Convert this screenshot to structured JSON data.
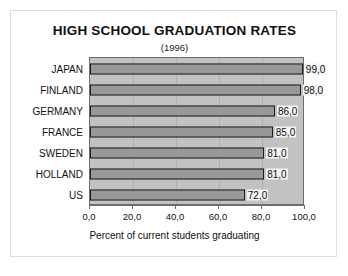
{
  "chart_data": {
    "type": "bar",
    "orientation": "horizontal",
    "title": "HIGH SCHOOL GRADUATION RATES",
    "subtitle": "(1996)",
    "xlabel": "Percent of current students graduating",
    "ylabel": "",
    "categories": [
      "JAPAN",
      "FINLAND",
      "GERMANY",
      "FRANCE",
      "SWEDEN",
      "HOLLAND",
      "US"
    ],
    "values": [
      99.0,
      98.0,
      86.0,
      85.0,
      81.0,
      81.0,
      72.0
    ],
    "data_labels": [
      "99,0",
      "98,0",
      "86,0",
      "85,0",
      "81,0",
      "81,0",
      "72,0"
    ],
    "xlim": [
      0,
      100
    ],
    "xticks": [
      0,
      20,
      40,
      60,
      80,
      100
    ],
    "xtick_labels": [
      "0,0",
      "20,0",
      "40,0",
      "60,0",
      "80,0",
      "100,0"
    ],
    "grid": true,
    "legend": null,
    "decimal_separator": ",",
    "colors": {
      "bar_fill": "#989898",
      "bar_border": "#1d1d1d",
      "plot_background": "#c2c2c2",
      "frame_border": "#dedede",
      "axis": "#6d6d6d",
      "text": "#111111",
      "label_background": "#f4f4f4"
    }
  }
}
